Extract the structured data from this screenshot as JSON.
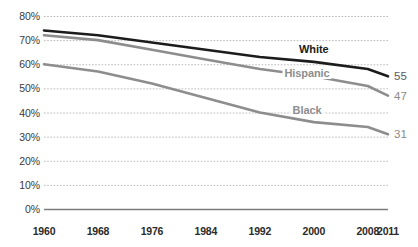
{
  "chart_data": {
    "type": "line",
    "title": "",
    "subtitle": "",
    "xlabel": "",
    "ylabel": "",
    "xlim": [
      1960,
      2011
    ],
    "ylim": [
      0,
      80
    ],
    "grid": true,
    "legend_position": "inline-right",
    "y_ticks": [
      "0%",
      "10%",
      "20%",
      "30%",
      "40%",
      "50%",
      "60%",
      "70%",
      "80%"
    ],
    "y_tick_values": [
      0,
      10,
      20,
      30,
      40,
      50,
      60,
      70,
      80
    ],
    "x_ticks": [
      "1960",
      "1968",
      "1976",
      "1984",
      "1992",
      "2000",
      "2008",
      "2011"
    ],
    "x_tick_values": [
      1960,
      1968,
      1976,
      1984,
      1992,
      2000,
      2008,
      2011
    ],
    "x": [
      1960,
      1968,
      1976,
      1984,
      1992,
      2000,
      2008,
      2011
    ],
    "series": [
      {
        "name": "White",
        "label": "White",
        "color": "#1c1c1c",
        "values": [
          74,
          72,
          69,
          66,
          63,
          61,
          58,
          55
        ],
        "end_value": "55",
        "end_value_color": "#5b5b5b",
        "label_x": 2000,
        "label_y": 66.5
      },
      {
        "name": "Hispanic",
        "label": "Hispanic",
        "color": "#8d8d8d",
        "values": [
          72,
          70,
          66,
          62,
          58,
          55,
          51,
          47
        ],
        "end_value": "47",
        "end_value_color": "#8a8a8a",
        "label_x": 1999,
        "label_y": 56.5
      },
      {
        "name": "Black",
        "label": "Black",
        "color": "#8d8d8d",
        "values": [
          60,
          57,
          52,
          46,
          40,
          36,
          34,
          31
        ],
        "end_value": "31",
        "end_value_color": "#8a8a8a",
        "label_x": 1999,
        "label_y": 41.0
      }
    ],
    "colors": {
      "white_line": "#1c1c1c",
      "hispanic_line": "#8d8d8d",
      "black_line": "#8d8d8d",
      "gridline": "#b9b9b9",
      "axis": "#7d7d7d",
      "tick_text": "#2b2b2b",
      "end_value_text": "#8a8a8a"
    }
  }
}
